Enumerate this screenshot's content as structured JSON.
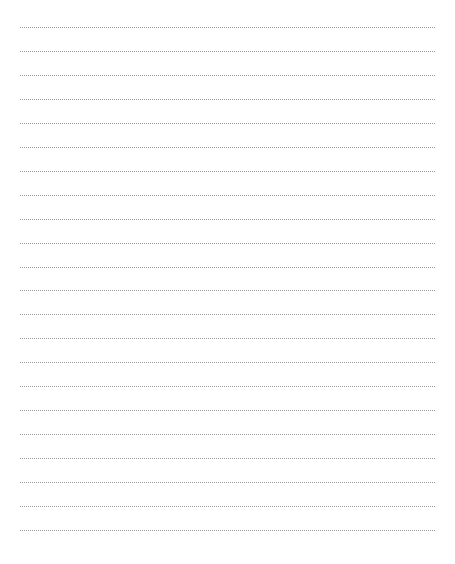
{
  "page": {
    "type": "lined-paper",
    "background_color": "#ffffff",
    "line_color": "#9a9a9a",
    "line_style": "dotted",
    "line_count": 22,
    "first_line_y": 27,
    "line_spacing": 23.95,
    "line_left_x": 20,
    "line_right_x": 435
  }
}
